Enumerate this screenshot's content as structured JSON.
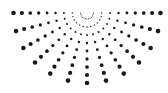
{
  "logo": {
    "name": "dotted-half-sunburst",
    "color": "#1a1a1a",
    "background": "#ffffff",
    "center": [
      87,
      13
    ],
    "rays": 13,
    "angle_start_deg": 0,
    "angle_end_deg": 180,
    "dots_per_ray": 9,
    "radius_min": 6,
    "radius_max": 70,
    "dot_size_min": 0.5,
    "dot_size_max": 2.3
  }
}
